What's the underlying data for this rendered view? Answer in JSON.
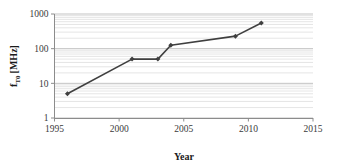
{
  "chart_data": {
    "type": "line",
    "title": "",
    "subtitle": "",
    "xlabel": "Year",
    "ylabel": "f_T0 [MHz]",
    "ylabel_base": "f",
    "ylabel_subscript": "T0",
    "ylabel_unit": "[MHz]",
    "yscale": "log",
    "xscale": "linear",
    "xlim": [
      1995,
      2015
    ],
    "ylim": [
      1,
      1000
    ],
    "xticks": [
      1995,
      2000,
      2005,
      2010,
      2015
    ],
    "xtick_labels": [
      "1995",
      "2000",
      "2005",
      "2010",
      "2015"
    ],
    "yticks": [
      1,
      10,
      100,
      1000
    ],
    "ytick_labels": [
      "1",
      "10",
      "100",
      "1000"
    ],
    "grid": "minor-horizontal-log",
    "legend": "none",
    "marker": "diamond",
    "series_color": "#3f3f3f",
    "x": [
      1996,
      2001,
      2003,
      2004,
      2009,
      2011
    ],
    "values": [
      5,
      50,
      50,
      125,
      230,
      550
    ],
    "points": [
      {
        "year": 1996,
        "f_T0": 5
      },
      {
        "year": 2001,
        "f_T0": 50
      },
      {
        "year": 2003,
        "f_T0": 50
      },
      {
        "year": 2004,
        "f_T0": 125
      },
      {
        "year": 2009,
        "f_T0": 230
      },
      {
        "year": 2011,
        "f_T0": 550
      }
    ]
  },
  "colors": {
    "series": "#3f3f3f",
    "axis": "#8c8c8c",
    "gridline": "#d4d4d4",
    "gridline_major": "#bcbcbc",
    "text": "#3a3a3a",
    "background": "#ffffff"
  }
}
